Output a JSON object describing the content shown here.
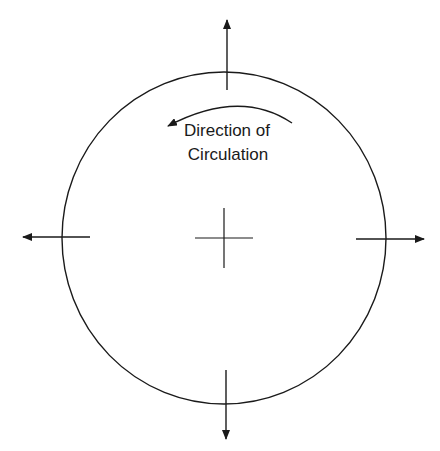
{
  "diagram": {
    "label_line1": "Direction of",
    "label_line2": "Circulation",
    "stroke_color": "#1a1a1a"
  }
}
